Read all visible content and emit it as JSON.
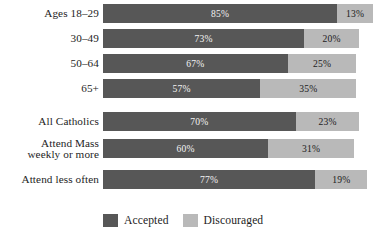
{
  "chart_data": {
    "type": "bar",
    "orientation": "horizontal",
    "stacked": true,
    "title": "",
    "subtitle": "",
    "xlabel": "",
    "ylabel": "",
    "xlim": [
      0,
      100
    ],
    "grid": false,
    "legend_position": "bottom-left",
    "categories": [
      "Ages 18–29",
      "30–49",
      "50–64",
      "65+",
      "All Catholics",
      "Attend Mass weekly or more",
      "Attend less often"
    ],
    "series": [
      {
        "name": "Accepted",
        "color": "#575757",
        "values": [
          85,
          73,
          67,
          57,
          70,
          60,
          77
        ],
        "labels": [
          "85%",
          "73%",
          "67%",
          "57%",
          "70%",
          "60%",
          "77%"
        ]
      },
      {
        "name": "Discouraged",
        "color": "#b9b9b9",
        "values": [
          13,
          20,
          25,
          35,
          23,
          31,
          19
        ],
        "labels": [
          "13%",
          "20%",
          "25%",
          "35%",
          "23%",
          "31%",
          "19%"
        ]
      }
    ],
    "legend": [
      "Accepted",
      "Discouraged"
    ]
  },
  "rows": [
    {
      "label_lines": [
        "Ages 18–29"
      ],
      "accepted_value": 85,
      "accepted_label": "85%",
      "discouraged_value": 13,
      "discouraged_label": "13%"
    },
    {
      "label_lines": [
        "30–49"
      ],
      "accepted_value": 73,
      "accepted_label": "73%",
      "discouraged_value": 20,
      "discouraged_label": "20%"
    },
    {
      "label_lines": [
        "50–64"
      ],
      "accepted_value": 67,
      "accepted_label": "67%",
      "discouraged_value": 25,
      "discouraged_label": "25%"
    },
    {
      "label_lines": [
        "65+"
      ],
      "accepted_value": 57,
      "accepted_label": "57%",
      "discouraged_value": 35,
      "discouraged_label": "35%"
    },
    {
      "label_lines": [
        "All Catholics"
      ],
      "accepted_value": 70,
      "accepted_label": "70%",
      "discouraged_value": 23,
      "discouraged_label": "23%"
    },
    {
      "label_lines": [
        "Attend Mass",
        "weekly or more"
      ],
      "accepted_value": 60,
      "accepted_label": "60%",
      "discouraged_value": 31,
      "discouraged_label": "31%"
    },
    {
      "label_lines": [
        "Attend less often"
      ],
      "accepted_value": 77,
      "accepted_label": "77%",
      "discouraged_value": 19,
      "discouraged_label": "19%"
    }
  ],
  "legend": {
    "items": [
      {
        "label": "Accepted",
        "color": "#575757"
      },
      {
        "label": "Discouraged",
        "color": "#b9b9b9"
      }
    ]
  },
  "colors": {
    "accepted": "#575757",
    "discouraged": "#b9b9b9",
    "background": "#ffffff",
    "text": "#1d1d1d",
    "value_on_dark": "#f2f2f2",
    "value_on_light": "#1c1c1c"
  },
  "layout": {
    "bar_left_px": 103,
    "bar_height_px": 19,
    "px_per_percent": 2.755,
    "row_tops_px": [
      4,
      29,
      54,
      79,
      112,
      139,
      170
    ],
    "row_label_two_line_index": 5
  }
}
